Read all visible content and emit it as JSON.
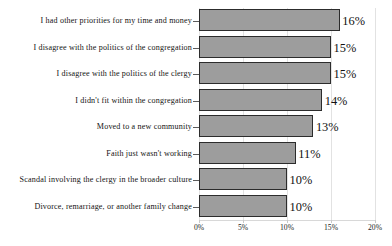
{
  "chart_data": {
    "type": "bar",
    "orientation": "horizontal",
    "title": "",
    "subtitle": "",
    "xlabel": "",
    "ylabel": "",
    "xlim": [
      0,
      20
    ],
    "xtick_labels": [
      "0%",
      "5%",
      "10%",
      "15%",
      "20%"
    ],
    "xtick_values": [
      0,
      5,
      10,
      15,
      20
    ],
    "grid": true,
    "grid_axis": "x",
    "legend": false,
    "value_suffix": "%",
    "bar_fill_color": "#9d9d9d",
    "bar_edge_color": "#2c2c2c",
    "categories": [
      "I had other priorities for my time and money",
      "I disagree with the politics of the congregation",
      "I disagree with the politics of the clergy",
      "I didn't fit within the congregation",
      "Moved to a new community",
      "Faith just wasn't working",
      "Scandal involving the clergy in the broader culture",
      "Divorce, remarriage, or another family change"
    ],
    "values": [
      16,
      15,
      15,
      14,
      13,
      11,
      10,
      10
    ],
    "data_labels": [
      "16%",
      "15%",
      "15%",
      "14%",
      "13%",
      "11%",
      "10%",
      "10%"
    ]
  }
}
